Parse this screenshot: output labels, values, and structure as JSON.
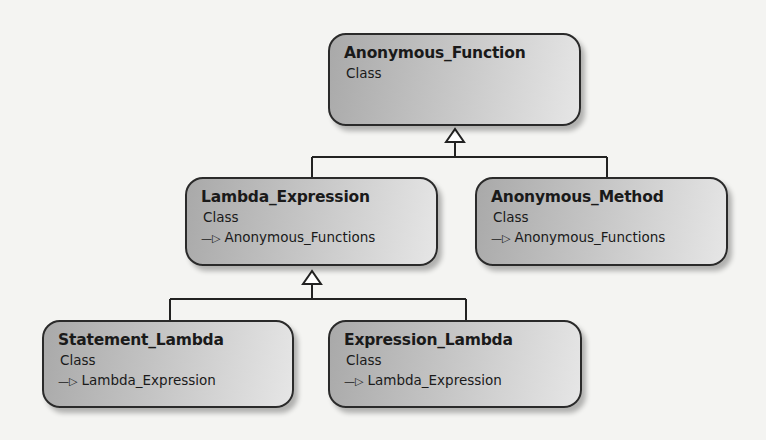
{
  "diagram": {
    "type": "uml-class-hierarchy",
    "nodes": [
      {
        "id": "anonymous_function",
        "title": "Anonymous_Function",
        "stereotype": "Class",
        "parent": null
      },
      {
        "id": "lambda_expression",
        "title": "Lambda_Expression",
        "stereotype": "Class",
        "parent": "Anonymous_Functions"
      },
      {
        "id": "anonymous_method",
        "title": "Anonymous_Method",
        "stereotype": "Class",
        "parent": "Anonymous_Functions"
      },
      {
        "id": "statement_lambda",
        "title": "Statement_Lambda",
        "stereotype": "Class",
        "parent": "Lambda_Expression"
      },
      {
        "id": "expression_lambda",
        "title": "Expression_Lambda",
        "stereotype": "Class",
        "parent": "Lambda_Expression"
      }
    ],
    "edges": [
      {
        "from": "lambda_expression",
        "to": "anonymous_function",
        "kind": "generalization"
      },
      {
        "from": "anonymous_method",
        "to": "anonymous_function",
        "kind": "generalization"
      },
      {
        "from": "statement_lambda",
        "to": "lambda_expression",
        "kind": "generalization"
      },
      {
        "from": "expression_lambda",
        "to": "lambda_expression",
        "kind": "generalization"
      }
    ],
    "inherit_arrow_glyph": "—▷",
    "colors": {
      "border": "#2a2a2a",
      "fill_dark": "#a9a9a9",
      "fill_light": "#e6e6e6",
      "background": "#f4f4f2"
    }
  }
}
